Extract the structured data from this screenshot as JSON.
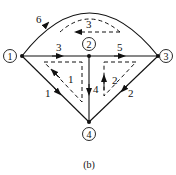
{
  "diagram": {
    "caption": "(b)",
    "nodes": [
      {
        "id": "1",
        "label": "1"
      },
      {
        "id": "2",
        "label": "2"
      },
      {
        "id": "3",
        "label": "3"
      },
      {
        "id": "4",
        "label": "4"
      }
    ],
    "edges": [
      {
        "label": "1",
        "from": "1",
        "to": "4"
      },
      {
        "label": "2",
        "from": "3",
        "to": "4"
      },
      {
        "label": "3",
        "from": "1",
        "to": "2"
      },
      {
        "label": "4",
        "from": "2",
        "to": "4"
      },
      {
        "label": "5",
        "from": "2",
        "to": "3"
      },
      {
        "label": "6",
        "from": "1",
        "to": "3"
      }
    ],
    "loops": [
      {
        "label": "1"
      },
      {
        "label": "2"
      },
      {
        "label": "3"
      }
    ],
    "colors": {
      "stroke": "#111111",
      "background": "#ffffff"
    }
  }
}
